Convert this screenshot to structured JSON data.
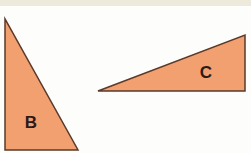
{
  "figure": {
    "background_color": "#fdfdfb",
    "top_band_color": "#eeeadb",
    "fill_color": "#f2a070",
    "stroke_color": "#5a3a2a",
    "label_color": "#2a1a1a"
  },
  "triangles": [
    {
      "id": "B",
      "label": "B",
      "points": "5,19 5,150 78,150",
      "label_x": 31,
      "label_y": 128,
      "orientation": "right angle at bottom-left, tall and narrow"
    },
    {
      "id": "C",
      "label": "C",
      "points": "98,91 245,35 245,91",
      "label_x": 206,
      "label_y": 78,
      "orientation": "right angle at bottom-right, long and flat"
    }
  ]
}
